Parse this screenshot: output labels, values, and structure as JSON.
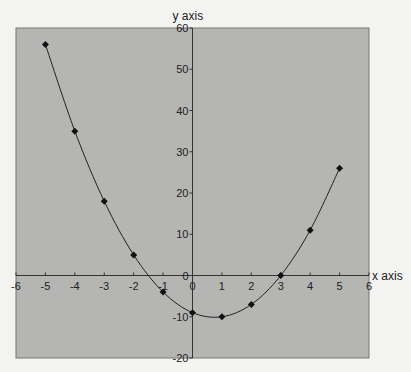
{
  "chart_data": {
    "type": "line",
    "title": "",
    "xlabel": "x axis",
    "ylabel": "y axis",
    "xlim": [
      -6,
      6
    ],
    "ylim": [
      -20,
      60
    ],
    "x_ticks": [
      -6,
      -5,
      -4,
      -3,
      -2,
      -1,
      0,
      1,
      2,
      3,
      4,
      5,
      6
    ],
    "y_ticks": [
      -20,
      -10,
      0,
      10,
      20,
      30,
      40,
      50,
      60
    ],
    "grid": false,
    "legend": null,
    "series": [
      {
        "name": "y = 2x² − 3x − 9",
        "x": [
          -5,
          -4,
          -3,
          -2,
          -1,
          0,
          1,
          2,
          3,
          4,
          5
        ],
        "values": [
          56,
          35,
          18,
          5,
          -4,
          -9,
          -10,
          -7,
          0,
          11,
          26
        ],
        "marker": "diamond",
        "smooth": true
      }
    ]
  },
  "colors": {
    "page_background": "#f3f3f1",
    "plot_background": "#b5b5b3",
    "axis": "#333333",
    "line": "#222222",
    "marker": "#111111"
  }
}
